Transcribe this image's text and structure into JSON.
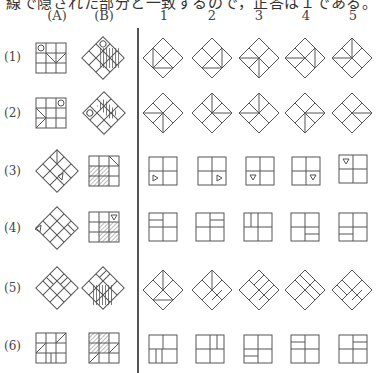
{
  "caption": "線で隠された部分と一致するので，正答は１である。",
  "headers": [
    "(A)",
    "(B)",
    "1",
    "2",
    "3",
    "4",
    "5"
  ],
  "rows": [
    {
      "label": "(1)"
    },
    {
      "label": "(2)"
    },
    {
      "label": "(3)"
    },
    {
      "label": "(4)"
    },
    {
      "label": "(5)"
    },
    {
      "label": "(6)"
    }
  ],
  "colors": {
    "line": "#555555",
    "text": "#333333",
    "background": "#ffffff"
  }
}
